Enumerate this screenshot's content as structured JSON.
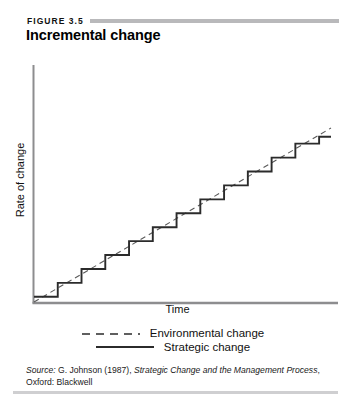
{
  "header": {
    "figure_number": "FIGURE 3.5",
    "title": "Incremental change"
  },
  "source": {
    "prefix": "Source:",
    "author_year": "G. Johnson (1987),",
    "work_title": "Strategic Change and the Management Process",
    "publisher": ", Oxford: Blackwell"
  },
  "colors": {
    "rule": "#b9b9bb",
    "axis": "#8d8d8f",
    "strategic_line": "#2b2b2b",
    "environmental_line": "#5a5a5a",
    "text": "#111111"
  },
  "chart_data": {
    "type": "line",
    "title": "Incremental change",
    "xlabel": "Time",
    "ylabel": "Rate of change",
    "xlim": [
      0,
      100
    ],
    "ylim": [
      0,
      100
    ],
    "grid": false,
    "axis_ticks": false,
    "legend_position": "below",
    "series": [
      {
        "name": "Environmental change",
        "style": "dashed",
        "description": "Smooth continuous straight line rising steadily from origin",
        "x": [
          0,
          100
        ],
        "y": [
          0,
          100
        ]
      },
      {
        "name": "Strategic change",
        "style": "solid-step",
        "description": "Staircase of 12 discrete steps oscillating around the environmental change trend line",
        "step_count": 12,
        "x": [
          0,
          8,
          8,
          16,
          16,
          24,
          24,
          32,
          32,
          40,
          40,
          48,
          48,
          56,
          56,
          64,
          64,
          72,
          72,
          80,
          80,
          88,
          88,
          96,
          96,
          100
        ],
        "y": [
          3,
          3,
          11,
          11,
          19,
          19,
          27,
          27,
          35,
          35,
          43,
          43,
          51,
          51,
          59,
          59,
          67,
          67,
          75,
          75,
          83,
          83,
          91,
          91,
          95,
          95
        ]
      }
    ]
  },
  "legend": {
    "items": [
      {
        "label": "Environmental change",
        "style": "dashed"
      },
      {
        "label": "Strategic change",
        "style": "solid"
      }
    ]
  }
}
